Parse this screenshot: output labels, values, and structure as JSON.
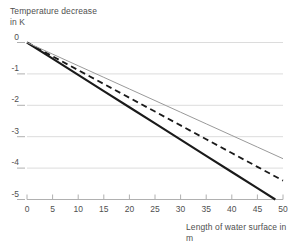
{
  "chart_data": {
    "type": "line",
    "title": "",
    "xlabel": "Length of water surface in m",
    "ylabel": "Temperature decrease\nin K",
    "ylabel_line1": "Temperature decrease",
    "ylabel_line2": "in K",
    "xlim": [
      0,
      50
    ],
    "ylim": [
      -5,
      0
    ],
    "xticks": [
      0,
      5,
      10,
      15,
      20,
      25,
      30,
      35,
      40,
      45,
      50
    ],
    "xtick_labels": [
      "0",
      "5",
      "10",
      "15",
      "20",
      "25",
      "30",
      "35",
      "40",
      "45",
      "50"
    ],
    "yticks": [
      0,
      -1,
      -2,
      -3,
      -4,
      -5
    ],
    "ytick_labels": [
      "0",
      "-1",
      "-2",
      "-3",
      "-4",
      "-5"
    ],
    "grid": "horizontal",
    "legend": "none",
    "colors": {
      "line_solid_thick": "#1a1a1a",
      "line_dashed": "#1a1a1a",
      "line_thin_gray": "#9a9a9a",
      "grid": "#dcdcdc",
      "axis": "#b0b0b0",
      "text": "#4f4f4f"
    },
    "series": [
      {
        "name": "solid-thick",
        "style": "solid",
        "width": 2.1,
        "color": "#1a1a1a",
        "x": [
          0,
          5,
          10,
          15,
          20,
          25,
          30,
          35,
          40,
          45,
          48.5
        ],
        "values": [
          0,
          -0.515,
          -1.03,
          -1.546,
          -2.062,
          -2.577,
          -3.093,
          -3.608,
          -4.124,
          -4.639,
          -5.0
        ]
      },
      {
        "name": "dashed",
        "style": "dashed",
        "width": 1.8,
        "color": "#1a1a1a",
        "x": [
          0,
          5,
          10,
          15,
          20,
          25,
          30,
          35,
          40,
          45,
          50
        ],
        "values": [
          0,
          -0.44,
          -0.88,
          -1.32,
          -1.76,
          -2.2,
          -2.64,
          -3.08,
          -3.52,
          -3.96,
          -4.4
        ]
      },
      {
        "name": "solid-thin-gray",
        "style": "solid",
        "width": 1.0,
        "color": "#9a9a9a",
        "x": [
          0,
          5,
          10,
          15,
          20,
          25,
          30,
          35,
          40,
          45,
          50
        ],
        "values": [
          0,
          -0.37,
          -0.74,
          -1.11,
          -1.48,
          -1.85,
          -2.22,
          -2.59,
          -2.96,
          -3.33,
          -3.7
        ]
      }
    ]
  },
  "axes": {
    "y_title_line1": "Temperature decrease",
    "y_title_line2": "in K",
    "x_title": "Length of water surface in m"
  },
  "ticks": {
    "y": [
      "0",
      "-1",
      "-2",
      "-3",
      "-4",
      "-5"
    ],
    "x": [
      "0",
      "5",
      "10",
      "15",
      "20",
      "25",
      "30",
      "35",
      "40",
      "45",
      "50"
    ]
  }
}
